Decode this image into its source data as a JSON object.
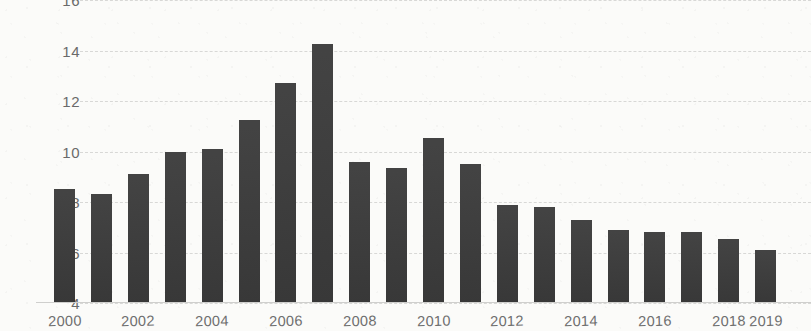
{
  "chart_data": {
    "type": "bar",
    "title": "",
    "subtitle": "",
    "xlabel": "",
    "ylabel": "",
    "categories": [
      "2000",
      "2001",
      "2002",
      "2003",
      "2004",
      "2005",
      "2006",
      "2007",
      "2008",
      "2009",
      "2010",
      "2011",
      "2012",
      "2013",
      "2014",
      "2015",
      "2016",
      "2017",
      "2018",
      "2019"
    ],
    "values": [
      8.5,
      8.3,
      9.1,
      10.0,
      10.1,
      11.25,
      12.7,
      14.25,
      9.6,
      9.35,
      10.55,
      9.5,
      7.9,
      7.8,
      7.3,
      6.9,
      6.8,
      6.8,
      6.55,
      6.1
    ],
    "series": [
      {
        "name": "",
        "values": [
          8.5,
          8.3,
          9.1,
          10.0,
          10.1,
          11.25,
          12.7,
          14.25,
          9.6,
          9.35,
          10.55,
          9.5,
          7.9,
          7.8,
          7.3,
          6.9,
          6.8,
          6.8,
          6.55,
          6.1
        ]
      }
    ],
    "ylim": [
      4,
      16
    ],
    "yticks": [
      4,
      6,
      8,
      10,
      12,
      14,
      16
    ],
    "ytick_labels": [
      "4",
      "6",
      "8",
      "10",
      "12",
      "14",
      "16"
    ],
    "xtick_labels": [
      "2000",
      "2002",
      "2004",
      "2006",
      "2008",
      "2010",
      "2012",
      "2014",
      "2016",
      "2018",
      "2019"
    ],
    "xtick_categories": [
      "2000",
      "2002",
      "2004",
      "2006",
      "2008",
      "2010",
      "2012",
      "2014",
      "2016",
      "2018",
      "2019"
    ],
    "grid": true,
    "grid_style": "dashed-horizontal",
    "legend": false,
    "legend_position": "none",
    "bar_color": "#3b3b3b",
    "grid_color": "#d8d8d6",
    "text_color": "#6a6a6a",
    "background_color": "#fbfbf9",
    "annotations": []
  }
}
